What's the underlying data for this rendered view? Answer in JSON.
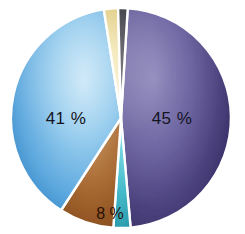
{
  "chart_data": {
    "type": "pie",
    "title": "",
    "subtitle": "",
    "xlabel": "",
    "ylabel": "",
    "grid": false,
    "legend_position": "none",
    "labels_inside": true,
    "categories": [
      "45 %",
      "41 %",
      "8 %",
      "cream sliver",
      "charcoal sliver",
      "cyan sliver"
    ],
    "values": [
      45,
      41,
      8,
      2,
      2,
      2
    ],
    "series": [
      {
        "name": "share",
        "values": [
          45,
          41,
          8,
          2,
          2,
          2
        ]
      }
    ],
    "slices": [
      {
        "name": "slice-purple",
        "label": "45 %",
        "value": 45,
        "show_label": true,
        "color": "#5a5090",
        "color_edge": "#352c66",
        "color_inner": "#7a72a8",
        "start_angle": 3.5,
        "end_angle": 175.0,
        "label_x": 172,
        "label_y": 124,
        "label_class": "slice-label"
      },
      {
        "name": "slice-cyan",
        "label": "",
        "value": 2,
        "show_label": false,
        "color": "#3fb8c8",
        "color_edge": "#2a97a8",
        "color_inner": "#6fd4de",
        "start_angle": 175.0,
        "end_angle": 184.0,
        "label_x": 0,
        "label_y": 0,
        "label_class": "slice-label"
      },
      {
        "name": "slice-brown",
        "label": "8 %",
        "value": 8,
        "show_label": true,
        "color": "#a0622f",
        "color_edge": "#8a4f22",
        "color_inner": "#b77a44",
        "start_angle": 184.0,
        "end_angle": 213.0,
        "label_x": 110,
        "label_y": 219,
        "label_class": "slice-label-brown"
      },
      {
        "name": "slice-blue",
        "label": "41 %",
        "value": 41,
        "show_label": true,
        "color": "#4f9fd8",
        "color_edge": "#2d7fc0",
        "color_inner": "#9fd0ee",
        "start_angle": 213.0,
        "end_angle": 351.0,
        "label_x": 66,
        "label_y": 124,
        "label_class": "slice-label"
      },
      {
        "name": "slice-cream",
        "label": "",
        "value": 2,
        "show_label": false,
        "color": "#f0e2a8",
        "color_edge": "#e2ce84",
        "color_inner": "#fbf4d4",
        "start_angle": 351.0,
        "end_angle": 358.5,
        "label_x": 0,
        "label_y": 0,
        "label_class": "slice-label"
      },
      {
        "name": "slice-charcoal",
        "label": "",
        "value": 2,
        "show_label": false,
        "color": "#4a4a52",
        "color_edge": "#32323a",
        "color_inner": "#6a6a74",
        "start_angle": 358.5,
        "end_angle": 363.5,
        "label_x": 0,
        "label_y": 0,
        "label_class": "slice-label"
      }
    ],
    "geometry": {
      "center_x": 121,
      "center_y": 118,
      "radius_x": 110,
      "radius_y": 110
    },
    "background_color": "#ffffff",
    "label_text_color": "#141422"
  }
}
